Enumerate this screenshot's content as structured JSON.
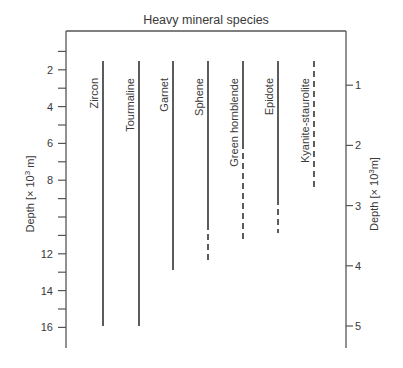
{
  "title": "Heavy mineral species",
  "left_axis": {
    "label": "Depth [× 10³ m]",
    "label_main": "Depth [× 10",
    "label_sup": "3",
    "label_end": " m]",
    "tick_labels": [
      "2",
      "4",
      "6",
      "8",
      "12",
      "14",
      "16"
    ]
  },
  "right_axis": {
    "label": "Depth [× 10³m]",
    "label_main": "Depth [× 10",
    "label_sup": "3",
    "label_end": "m]",
    "tick_labels": [
      "1",
      "2",
      "3",
      "4",
      "5"
    ]
  },
  "chart_data": {
    "type": "range",
    "title": "Heavy mineral species",
    "ylabel_left": "Depth [× 10³ m]",
    "ylabel_right": "Depth [× 10³m]",
    "ylim_left": [
      0.5,
      17
    ],
    "ylim_right": [
      0.1,
      5.2
    ],
    "left_ticks": [
      1,
      2,
      3,
      4,
      5,
      6,
      7,
      8,
      9,
      10,
      11,
      12,
      13,
      14,
      15,
      16
    ],
    "left_tick_labels": [
      2,
      4,
      6,
      8,
      12,
      14,
      16
    ],
    "right_tick_labels": [
      1,
      2,
      3,
      4,
      5
    ],
    "series": [
      {
        "name": "Zircon",
        "solid_top_km_right": 0.5,
        "solid_bottom_km_right": 5.0,
        "dashed_bottom_km_right": null
      },
      {
        "name": "Tourmaline",
        "solid_top_km_right": 0.5,
        "solid_bottom_km_right": 5.0,
        "dashed_bottom_km_right": null
      },
      {
        "name": "Garnet",
        "solid_top_km_right": 0.5,
        "solid_bottom_km_right": 4.0,
        "dashed_bottom_km_right": null
      },
      {
        "name": "Sphene",
        "solid_top_km_right": 0.5,
        "solid_bottom_km_right": 3.3,
        "dashed_bottom_km_right": 3.9
      },
      {
        "name": "Green hornblende",
        "solid_top_km_right": 0.5,
        "solid_bottom_km_right": 2.0,
        "dashed_bottom_km_right": 3.5
      },
      {
        "name": "Epidote",
        "solid_top_km_right": 0.5,
        "solid_bottom_km_right": 2.9,
        "dashed_bottom_km_right": 3.4
      },
      {
        "name": "Kyanite-staurolite",
        "solid_top_km_right": null,
        "solid_bottom_km_right": null,
        "dashed_top_km_right": 0.5,
        "dashed_bottom_km_right": 2.7
      }
    ]
  },
  "species": [
    {
      "name": "Zircon",
      "x": 103,
      "solid": [
        61,
        326
      ],
      "dashed": null
    },
    {
      "name": "Tourmaline",
      "x": 139,
      "solid": [
        61,
        326
      ],
      "dashed": null
    },
    {
      "name": "Garnet",
      "x": 173,
      "solid": [
        61,
        270
      ],
      "dashed": null
    },
    {
      "name": "Sphene",
      "x": 208,
      "solid": [
        61,
        224
      ],
      "dashed": [
        224,
        260
      ]
    },
    {
      "name": "Green hornblende",
      "x": 243,
      "solid": [
        61,
        143
      ],
      "dashed": [
        143,
        240
      ]
    },
    {
      "name": "Epidote",
      "x": 278,
      "solid": [
        61,
        199
      ],
      "dashed": [
        199,
        233
      ]
    },
    {
      "name": "Kyanite-staurolite",
      "x": 314,
      "solid": null,
      "dashed": [
        61,
        189
      ]
    }
  ]
}
